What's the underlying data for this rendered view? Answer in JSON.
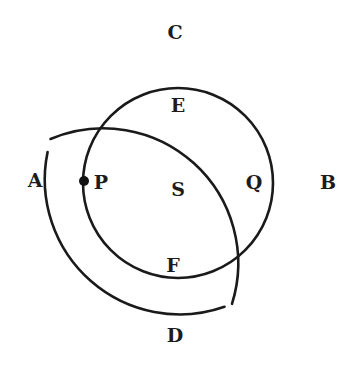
{
  "diagram": {
    "type": "concentric-circles",
    "stroke_color": "#1a1a1a",
    "background": "#ffffff",
    "outer_circle": {
      "center": [
        178,
        180
      ],
      "radius": 135,
      "gaps_note": "small breaks near A (upper-left) and lower-right between D and B"
    },
    "inner_circle": {
      "center": [
        178,
        183
      ],
      "radius": 95
    },
    "point": {
      "name": "P",
      "x": 84,
      "y": 181
    },
    "labels": {
      "A": "A",
      "B": "B",
      "C": "C",
      "D": "D",
      "E": "E",
      "F": "F",
      "P": "P",
      "Q": "Q",
      "S": "S"
    }
  }
}
